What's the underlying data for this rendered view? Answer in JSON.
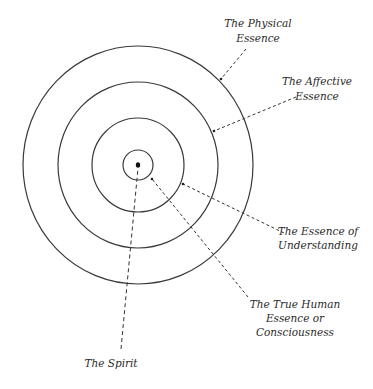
{
  "diagram": {
    "type": "concentric-circles",
    "center": {
      "x": 138,
      "y": 165
    },
    "stroke_color": "#3a3a3a",
    "rings": [
      {
        "name": "The Physical Essence",
        "rx": 115,
        "ry": 119
      },
      {
        "name": "The Affective Essence",
        "rx": 80,
        "ry": 83
      },
      {
        "name": "The Essence of Understanding",
        "rx": 46,
        "ry": 47
      },
      {
        "name": "The True Human Essence or Consciousness",
        "rx": 15,
        "ry": 15
      }
    ],
    "core": {
      "name": "The Spirit"
    }
  },
  "labels": {
    "physical": {
      "line1": "The Physical",
      "line2": "Essence"
    },
    "affective": {
      "line1": "The Affective",
      "line2": "Essence"
    },
    "understanding": {
      "line1": "The Essence of",
      "line2": "Understanding"
    },
    "true_human": {
      "line1": "The True Human",
      "line2": "Essence or",
      "line3": "Consciousness"
    },
    "spirit": {
      "line1": "The Spirit"
    }
  }
}
